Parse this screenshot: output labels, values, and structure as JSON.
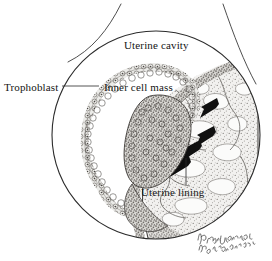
{
  "figure": {
    "kind": "medical-illustration",
    "style": "pen-and-ink stipple drawing, grayscale",
    "background_color": "#ffffff",
    "ink_color": "#1a1a1a"
  },
  "labels": {
    "uterine_cavity": "Uterine cavity",
    "trophoblast": "Trophoblast",
    "inner_cell_mass": "Inner cell mass",
    "uterine_lining": "Uterine lining"
  },
  "signature": {
    "text": "handwritten-artist-signature",
    "line1": "Paula DiSanto",
    "line2": "Bensadoun '92"
  },
  "structures": {
    "magnified_circle": {
      "name": "magnification-circle",
      "center_x": 156,
      "center_y": 135,
      "radius": 104
    },
    "uterus_outline_curves": [
      {
        "name": "uterus-wall-left-curve"
      },
      {
        "name": "uterus-wall-right-curve"
      }
    ],
    "trophoblast_ring": {
      "name": "trophoblast-cell-ring",
      "cell_count_approx": 58
    },
    "inner_cell_mass_cluster": {
      "name": "inner-cell-mass-cluster"
    },
    "endometrium": {
      "name": "uterine-lining-endometrium"
    },
    "arrows": {
      "name": "invasion-direction-arrows",
      "count": 4,
      "direction": "down-left",
      "color": "#111111"
    }
  },
  "leader_lines": {
    "trophoblast": {
      "from_x": 62,
      "from_y": 86,
      "to_x": 99,
      "to_y": 86
    },
    "uterine_lining": {
      "from_x": 186,
      "from_y": 185,
      "to_x": 186,
      "to_y": 160
    }
  }
}
